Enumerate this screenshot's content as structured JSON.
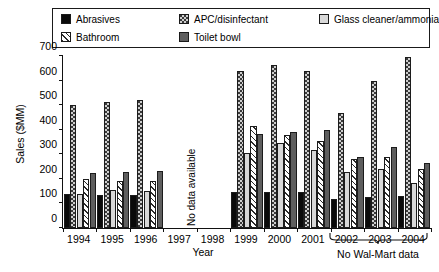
{
  "legend": {
    "items": [
      {
        "label": "Abrasives",
        "pattern": "solid-black",
        "swatch_name": "legend-swatch-abrasives"
      },
      {
        "label": "APC/disinfectant",
        "pattern": "dots",
        "swatch_name": "legend-swatch-apc-disinfectant"
      },
      {
        "label": "Glass cleaner/ammonia",
        "pattern": "light-gray",
        "swatch_name": "legend-swatch-glass-cleaner"
      },
      {
        "label": "Bathroom",
        "pattern": "hatch",
        "swatch_name": "legend-swatch-bathroom"
      },
      {
        "label": "Toilet bowl",
        "pattern": "dark-gray",
        "swatch_name": "legend-swatch-toilet-bowl"
      }
    ]
  },
  "annotations": {
    "no_data_available": "No data available",
    "no_walmart_data": "No Wal-Mart data"
  },
  "axes": {
    "y_title": "Sales ($MM)",
    "x_title": "Year",
    "y_ticks": [
      "0",
      "100",
      "200",
      "300",
      "400",
      "500",
      "600",
      "700"
    ],
    "x_ticks": [
      "1994",
      "1995",
      "1996",
      "1997",
      "1998",
      "1999",
      "2000",
      "2001",
      "2002",
      "2003",
      "2004"
    ]
  },
  "colors": {
    "axis": "#111111",
    "bar_outline": "#1c1c1c",
    "solid_black": "#0a0a0a",
    "dark_gray": "#5e5e5e",
    "light_gray": "#d8d8d8",
    "dots_bg": "#cfcfcf",
    "background": "#ffffff"
  },
  "chart_data": {
    "type": "bar",
    "title": "",
    "subtitle": "",
    "xlabel": "Year",
    "ylabel": "Sales ($MM)",
    "ylim": [
      0,
      700
    ],
    "ytick_step": 100,
    "grid": false,
    "legend_position": "top",
    "categories": [
      "1994",
      "1995",
      "1996",
      "1997",
      "1998",
      "1999",
      "2000",
      "2001",
      "2002",
      "2003",
      "2004"
    ],
    "bar_order_within_group": [
      "Abrasives",
      "APC/disinfectant",
      "Glass cleaner/ammonia",
      "Bathroom",
      "Toilet bowl"
    ],
    "missing_categories": [
      "1997",
      "1998"
    ],
    "annotations": [
      {
        "text": "No data available",
        "covers": [
          "1997",
          "1998"
        ],
        "orientation": "vertical"
      },
      {
        "text": "No Wal-Mart data",
        "covers": [
          "2002",
          "2003",
          "2004"
        ],
        "orientation": "horizontal",
        "marker": "brace"
      }
    ],
    "series": [
      {
        "name": "Abrasives",
        "values": [
          140,
          135,
          133,
          null,
          null,
          145,
          148,
          145,
          120,
          128,
          130
        ]
      },
      {
        "name": "APC/disinfectant",
        "values": [
          500,
          512,
          522,
          null,
          null,
          637,
          665,
          637,
          470,
          600,
          695
        ]
      },
      {
        "name": "Glass cleaner/ammonia",
        "values": [
          138,
          155,
          152,
          null,
          null,
          305,
          345,
          318,
          228,
          240,
          185
        ]
      },
      {
        "name": "Bathroom",
        "values": [
          200,
          190,
          192,
          null,
          null,
          415,
          378,
          355,
          282,
          290,
          240
        ]
      },
      {
        "name": "Toilet bowl",
        "values": [
          222,
          228,
          232,
          null,
          null,
          383,
          392,
          398,
          288,
          330,
          265
        ]
      }
    ]
  }
}
